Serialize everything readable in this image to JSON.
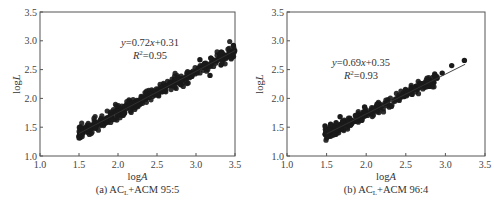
{
  "chart_data": [
    {
      "type": "scatter",
      "panel": "a",
      "caption": "(a) AC",
      "caption_sub": "L",
      "caption_rest": "+ACM 95:5",
      "xlabel": "logA",
      "ylabel": "logL",
      "xlim": [
        1.0,
        3.5
      ],
      "ylim": [
        1.0,
        3.5
      ],
      "xticks": [
        "1.0",
        "1.5",
        "2.0",
        "2.5",
        "3.0",
        "3.5"
      ],
      "yticks": [
        "1.0",
        "1.5",
        "2.0",
        "2.5",
        "3.0",
        "3.5"
      ],
      "grid": false,
      "fit": {
        "slope": 0.72,
        "intercept": 0.31,
        "x_range": [
          1.5,
          3.5
        ]
      },
      "equation": "y=0.72x+0.31",
      "r2_label": "R",
      "r2_value": "=0.95",
      "point_color": "#1a1a1a",
      "x_range": [
        1.5,
        3.5
      ],
      "n_points": 420,
      "noise": 0.055,
      "outliers": [
        [
          3.48,
          2.92
        ],
        [
          3.33,
          2.8
        ],
        [
          3.32,
          2.58
        ],
        [
          3.18,
          2.4
        ],
        [
          3.05,
          2.67
        ],
        [
          3.19,
          2.7
        ]
      ]
    },
    {
      "type": "scatter",
      "panel": "b",
      "caption": "(b) AC",
      "caption_sub": "L",
      "caption_rest": "+ACM 96:4",
      "xlabel": "logA",
      "ylabel": "logL",
      "xlim": [
        1.0,
        3.5
      ],
      "ylim": [
        1.0,
        3.5
      ],
      "xticks": [
        "1.0",
        "1.5",
        "2.0",
        "2.5",
        "3.0",
        "3.5"
      ],
      "yticks": [
        "1.0",
        "1.5",
        "2.0",
        "2.5",
        "3.0",
        "3.5"
      ],
      "grid": false,
      "fit": {
        "slope": 0.69,
        "intercept": 0.35,
        "x_range": [
          1.5,
          3.25
        ]
      },
      "equation": "y=0.69x+0.35",
      "r2_label": "R",
      "r2_value": "=0.93",
      "point_color": "#1a1a1a",
      "x_range": [
        1.48,
        2.9
      ],
      "n_points": 300,
      "noise": 0.05,
      "outliers": [
        [
          3.24,
          2.66
        ],
        [
          3.08,
          2.57
        ],
        [
          2.96,
          2.44
        ],
        [
          2.87,
          2.38
        ],
        [
          2.78,
          2.28
        ],
        [
          2.68,
          2.2
        ],
        [
          2.58,
          2.07
        ],
        [
          1.48,
          1.52
        ],
        [
          1.55,
          1.55
        ],
        [
          1.62,
          1.58
        ],
        [
          1.67,
          1.68
        ],
        [
          1.98,
          1.85
        ]
      ]
    }
  ]
}
